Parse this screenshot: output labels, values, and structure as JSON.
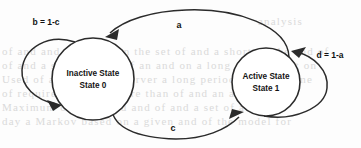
{
  "diagram": {
    "type": "state-transition-diagram",
    "background_color": "#fdfdfd",
    "stroke_color": "#2b2b2b",
    "text_color": "#121212",
    "states": [
      {
        "id": "state0",
        "name": "Inactive State",
        "sub_label": "State 0",
        "cx": 93,
        "cy": 79,
        "r": 41
      },
      {
        "id": "state1",
        "name": "Active State",
        "sub_label": "State 1",
        "cx": 266,
        "cy": 82,
        "r": 34
      }
    ],
    "transitions": [
      {
        "id": "t-a",
        "label": "a",
        "from": "state1",
        "to": "state0",
        "position": "top-arc",
        "label_x": 179,
        "label_y": 25
      },
      {
        "id": "t-c",
        "label": "c",
        "from": "state0",
        "to": "state1",
        "position": "bottom-arc",
        "label_x": 173,
        "label_y": 128
      },
      {
        "id": "t-b",
        "label": "b = 1-c",
        "from": "state0",
        "to": "state0",
        "position": "left-self-loop",
        "label_x": 46,
        "label_y": 22
      },
      {
        "id": "t-d",
        "label": "d = 1-a",
        "from": "state1",
        "to": "state1",
        "position": "right-self-loop",
        "label_x": 330,
        "label_y": 55
      }
    ]
  },
  "background_ghost_text": {
    "note": "faint scanned bleed-through text behind the diagram",
    "lines": [
      {
        "text": "analysis",
        "x": 258,
        "y": 22
      },
      {
        "text": "of and and a lot and on the set of and a short on the and of",
        "x": 4,
        "y": 52
      },
      {
        "text": "of and a short on and of an and on a long and of a set on",
        "x": 4,
        "y": 66
      },
      {
        "text": "Used of a minimum a server a long period of and a time",
        "x": 4,
        "y": 80
      },
      {
        "text": "of  required  the  of  a  more  than  of  and  an  and  on",
        "x": 4,
        "y": 94
      },
      {
        "text": "Maximum  of  10  in  and  and  of  and  a  set  of  a",
        "x": 4,
        "y": 108
      },
      {
        "text": "day  a  Markov  based  on  a  given  and  of  the  model  for",
        "x": 4,
        "y": 122
      }
    ]
  }
}
